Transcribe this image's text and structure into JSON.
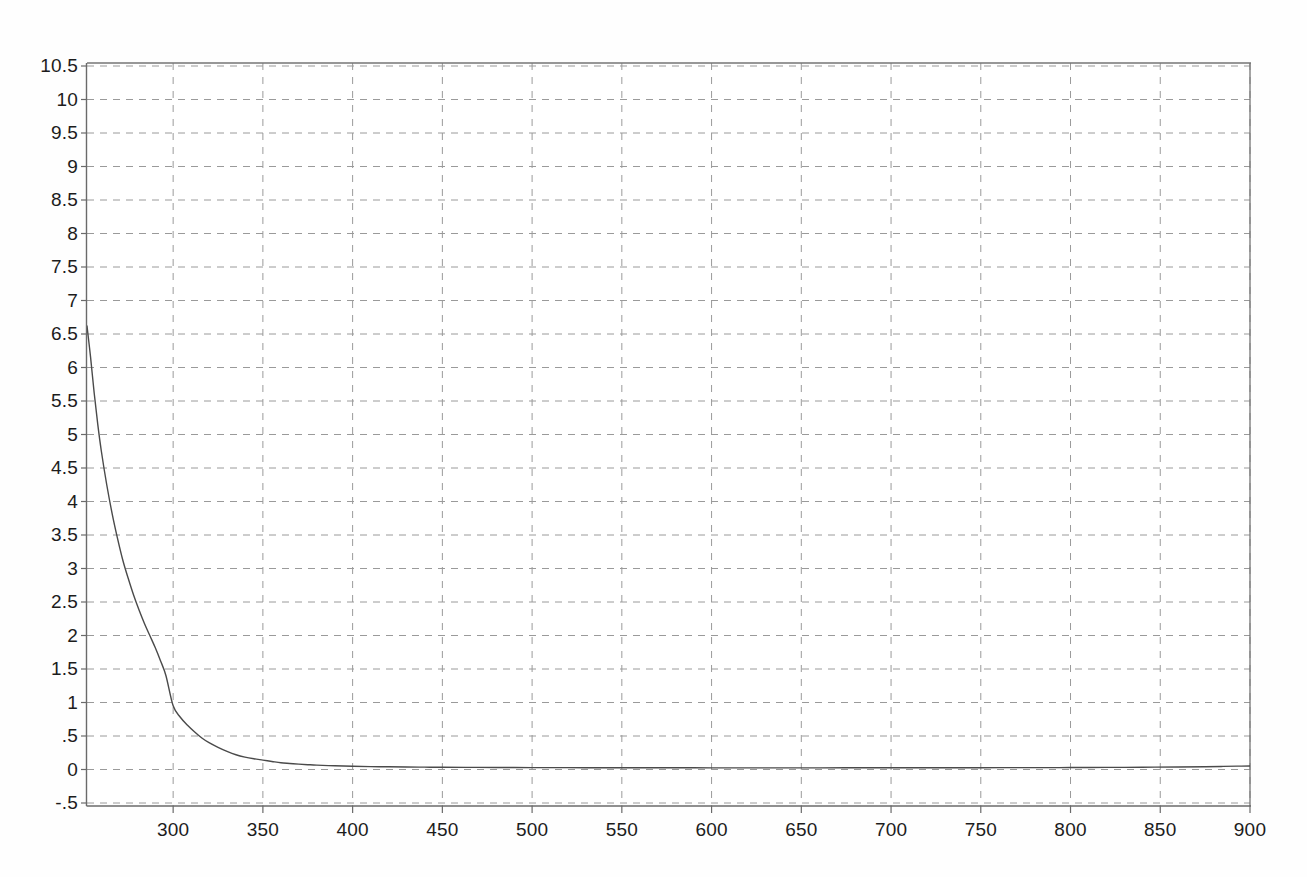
{
  "page": {
    "background_color": "#fefefe",
    "plot_background_color": "#ffffff"
  },
  "chart_data": {
    "type": "line",
    "title": "",
    "subtitle": "",
    "xlabel": "",
    "ylabel": "",
    "xlim": [
      252,
      900
    ],
    "ylim": [
      -0.5,
      10.5
    ],
    "grid": true,
    "grid_style": "dashed",
    "grid_color": "#9a9a9a",
    "legend": "none",
    "axis_color": "#6f6f6f",
    "line_color": "#4a4a4a",
    "line_width": 1.4,
    "x_ticks": [
      300,
      350,
      400,
      450,
      500,
      550,
      600,
      650,
      700,
      750,
      800,
      850,
      900
    ],
    "x_tick_labels": [
      "300",
      "350",
      "400",
      "450",
      "500",
      "550",
      "600",
      "650",
      "700",
      "750",
      "800",
      "850",
      "900"
    ],
    "y_ticks": [
      -0.5,
      0,
      0.5,
      1,
      1.5,
      2,
      2.5,
      3,
      3.5,
      4,
      4.5,
      5,
      5.5,
      6,
      6.5,
      7,
      7.5,
      8,
      8.5,
      9,
      9.5,
      10,
      10.5
    ],
    "y_tick_labels": [
      "-.5",
      "0",
      ".5",
      "1",
      "1.5",
      "2",
      "2.5",
      "3",
      "3.5",
      "4",
      "4.5",
      "5",
      "5.5",
      "6",
      "6.5",
      "7",
      "7.5",
      "8",
      "8.5",
      "9",
      "9.5",
      "10",
      "10.5"
    ],
    "series": [
      {
        "name": "decay",
        "x": [
          252,
          254,
          256,
          258,
          260,
          263,
          266,
          269,
          272,
          275,
          278,
          281,
          284,
          287,
          290,
          293,
          296,
          300,
          304,
          308,
          312,
          316,
          320,
          325,
          330,
          335,
          340,
          345,
          350,
          355,
          360,
          365,
          370,
          375,
          380,
          390,
          400,
          410,
          420,
          430,
          440,
          450,
          470,
          490,
          510,
          530,
          550,
          570,
          600,
          630,
          660,
          690,
          720,
          750,
          780,
          800,
          820,
          840,
          860,
          875,
          885,
          893,
          900
        ],
        "y": [
          6.62,
          6.15,
          5.62,
          5.15,
          4.75,
          4.25,
          3.82,
          3.45,
          3.12,
          2.85,
          2.6,
          2.38,
          2.18,
          2.0,
          1.82,
          1.62,
          1.4,
          0.95,
          0.78,
          0.66,
          0.56,
          0.47,
          0.4,
          0.33,
          0.27,
          0.22,
          0.185,
          0.16,
          0.14,
          0.12,
          0.1,
          0.09,
          0.08,
          0.072,
          0.065,
          0.055,
          0.048,
          0.043,
          0.04,
          0.037,
          0.035,
          0.033,
          0.031,
          0.029,
          0.028,
          0.027,
          0.026,
          0.026,
          0.025,
          0.025,
          0.025,
          0.026,
          0.026,
          0.027,
          0.028,
          0.029,
          0.031,
          0.034,
          0.038,
          0.042,
          0.046,
          0.05,
          0.053
        ]
      }
    ]
  },
  "axes": {
    "left_border": true,
    "bottom_border": true,
    "top_border": true,
    "right_border": true,
    "tick_marks": true
  }
}
